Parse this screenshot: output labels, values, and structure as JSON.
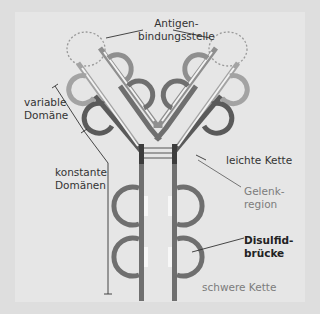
{
  "diagram": {
    "colors": {
      "background": "#dedede",
      "panel": "#e6e6e6",
      "heavy_chain": "#6f6f6f",
      "light_chain_variable": "#a3a3a3",
      "light_chain_constant": "#5a5a5a",
      "heavy_variable": "#8f8f8f",
      "hinge_dark": "#3c3c3c",
      "inner_fill": "#f3f3f3",
      "label_text": "#333333",
      "label_gray": "#7c7c7c"
    },
    "labels": {
      "antigen_line1": "Antigen-",
      "antigen_line2": "bindungsstelle",
      "variable_line1": "variable",
      "variable_line2": "Domäne",
      "constant_line1": "konstante",
      "constant_line2": "Domänen",
      "light_chain": "leichte Kette",
      "hinge_line1": "Gelenk-",
      "hinge_line2": "region",
      "disulfide_line1": "Disulfid-",
      "disulfide_line2": "brücke",
      "heavy_chain": "schwere Kette"
    }
  }
}
